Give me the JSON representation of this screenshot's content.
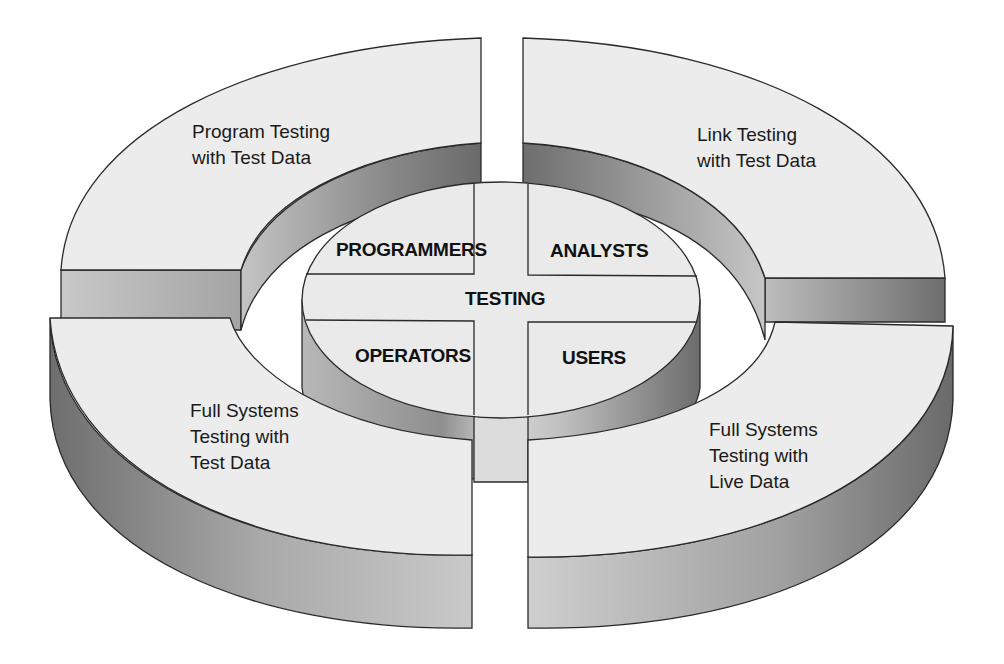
{
  "diagram": {
    "outer_ring": {
      "top_left": [
        "Program Testing",
        "with Test Data"
      ],
      "top_right": [
        "Link Testing",
        "with Test Data"
      ],
      "bottom_left": [
        "Full Systems",
        "Testing with",
        "Test Data"
      ],
      "bottom_right": [
        "Full Systems",
        "Testing with",
        "Live Data"
      ]
    },
    "center": {
      "title": "TESTING",
      "roles": {
        "top_left": "PROGRAMMERS",
        "top_right": "ANALYSTS",
        "bottom_left": "OPERATORS",
        "bottom_right": "USERS"
      }
    },
    "colors": {
      "top_face": "#ececec",
      "side_light": "#c8c8c8",
      "side_dark": "#7a7a7a",
      "outline": "#2a2a2a",
      "background": "#ffffff"
    }
  }
}
